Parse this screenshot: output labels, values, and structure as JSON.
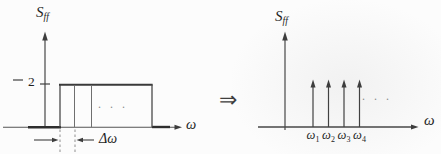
{
  "figure": {
    "type": "spectral-density-approximation-diagram",
    "implies": "⇒"
  },
  "left_plot": {
    "y_label_base": "S",
    "y_label_sub": "ff",
    "x_label": "ω",
    "y_tick_value": "2",
    "band_height": 2,
    "band_dots": ". . .",
    "delta_omega": "Δω"
  },
  "right_plot": {
    "y_label_base": "S",
    "y_label_sub": "ff",
    "x_label": "ω",
    "dots": ". . .",
    "impulses": [
      {
        "base": "ω",
        "sub": "1"
      },
      {
        "base": "ω",
        "sub": "2"
      },
      {
        "base": "ω",
        "sub": "3"
      },
      {
        "base": "ω",
        "sub": "4"
      }
    ]
  }
}
